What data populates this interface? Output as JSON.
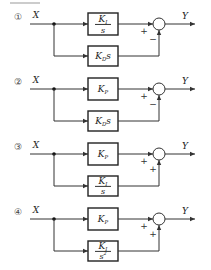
{
  "header": {
    "text": "三五1"
  },
  "options": [
    {
      "number": "①",
      "input": "X",
      "output": "Y",
      "top_block": {
        "type": "fraction",
        "num": "K",
        "num_sub": "I",
        "den": "s"
      },
      "bottom_block": {
        "type": "inline",
        "main": "K",
        "sub": "D",
        "tail": "s"
      },
      "top_sign": "+",
      "bottom_sign": "−"
    },
    {
      "number": "②",
      "input": "X",
      "output": "Y",
      "top_block": {
        "type": "inline",
        "main": "K",
        "sub": "P",
        "tail": ""
      },
      "bottom_block": {
        "type": "inline",
        "main": "K",
        "sub": "D",
        "tail": "s"
      },
      "top_sign": "+",
      "bottom_sign": "−"
    },
    {
      "number": "③",
      "input": "X",
      "output": "Y",
      "top_block": {
        "type": "inline",
        "main": "K",
        "sub": "P",
        "tail": ""
      },
      "bottom_block": {
        "type": "fraction",
        "num": "K",
        "num_sub": "I",
        "den": "s"
      },
      "top_sign": "+",
      "bottom_sign": "+"
    },
    {
      "number": "④",
      "input": "X",
      "output": "Y",
      "top_block": {
        "type": "inline",
        "main": "K",
        "sub": "P",
        "tail": ""
      },
      "bottom_block": {
        "type": "fraction",
        "num": "K",
        "num_sub": "I",
        "den": "s",
        "den_sup": "2"
      },
      "top_sign": "+",
      "bottom_sign": "+"
    }
  ]
}
